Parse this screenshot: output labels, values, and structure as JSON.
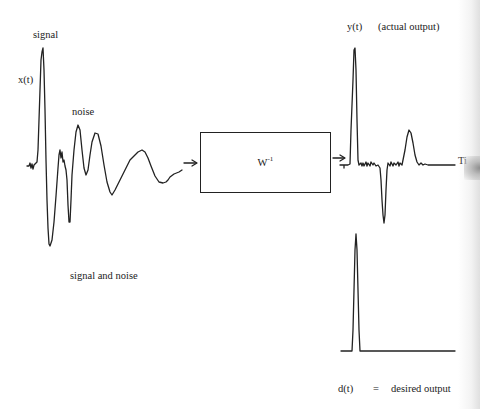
{
  "diagram": {
    "type": "inverse-filter-block-diagram",
    "input": {
      "signal_label": "signal",
      "axis_label": "x(t)",
      "noise_label": "noise",
      "caption": "signal and noise"
    },
    "filter": {
      "label_base": "W",
      "label_exponent": "-1"
    },
    "output_actual": {
      "axis_label": "y(t)",
      "description": "(actual output)",
      "time_axis_label": "Ti"
    },
    "output_desired": {
      "axis_label": "d(t)",
      "equals": "=",
      "description": "desired output"
    },
    "colors": {
      "ink": "#222222",
      "background": "#ffffff"
    }
  }
}
